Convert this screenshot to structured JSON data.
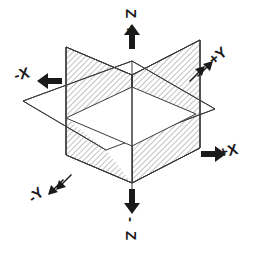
{
  "figure": {
    "type": "3d-coordinate-planes-diagram",
    "background_color": "#ffffff",
    "line_color": "#3a3a3a",
    "hatch_color": "#8a8a8a",
    "label_color": "#1a1a1a",
    "plane_fill_unhatched": "#ffffff"
  },
  "axis_labels": {
    "z_positive": {
      "text": "Z+",
      "arrow": "arrow-up-icon",
      "direction": "up"
    },
    "z_negative": {
      "text": "-Z",
      "arrow": "arrow-down-icon",
      "direction": "down"
    },
    "x_positive": {
      "text": "+X",
      "arrow": "arrow-right-icon",
      "direction": "right"
    },
    "x_negative": {
      "text": "-X",
      "arrow": "arrow-left-icon",
      "direction": "left"
    },
    "y_positive": {
      "text": "+Y",
      "arrow": "arrow-up-right-icon",
      "direction": "up-right"
    },
    "y_negative": {
      "text": "-Y",
      "arrow": "arrow-down-left-icon",
      "direction": "down-left"
    }
  },
  "label_glyphs": {
    "z_positive_line1": "Z",
    "z_positive_line2": "+",
    "z_negative_line1": "-",
    "z_negative_line2": "Z",
    "x_positive": "+X",
    "x_negative": "-X",
    "y_positive": "+Y",
    "y_negative": "-Y"
  },
  "planes": [
    {
      "name": "xz-plane-left",
      "orientation": "vertical",
      "fill": "hatched",
      "description": "Vertical plane receding to upper-left, drawn with fine diagonal hatching"
    },
    {
      "name": "yz-plane-right",
      "orientation": "vertical",
      "fill": "hatched",
      "description": "Vertical plane receding to upper-right, drawn with fine diagonal hatching"
    },
    {
      "name": "xy-plane-horizontal",
      "orientation": "horizontal",
      "fill": "none",
      "description": "Horizontal plane shown as an unfilled parallelogram"
    }
  ]
}
